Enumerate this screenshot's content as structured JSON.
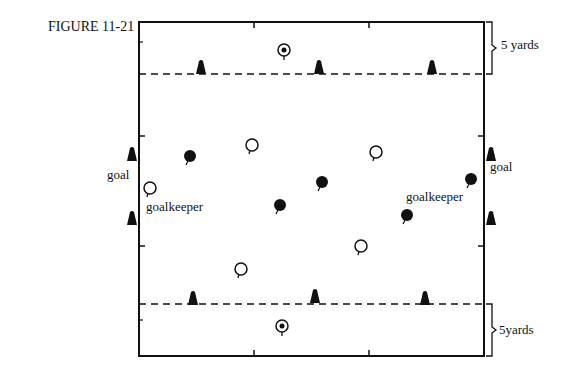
{
  "figure": {
    "title": "FIGURE 11-21",
    "labels": {
      "top_distance": "5 yards",
      "bottom_distance": "5yards",
      "goal_left": "goal",
      "goal_right": "goal",
      "goalkeeper_left": "goalkeeper",
      "goalkeeper_right": "goalkeeper"
    },
    "field": {
      "left": 139,
      "top": 22,
      "right": 484,
      "bottom": 356
    },
    "zone_lines_y": [
      74,
      304
    ],
    "cones": [
      {
        "x": 201,
        "y": 68
      },
      {
        "x": 319,
        "y": 68
      },
      {
        "x": 432,
        "y": 68
      },
      {
        "x": 193,
        "y": 299
      },
      {
        "x": 315,
        "y": 297
      },
      {
        "x": 425,
        "y": 299
      },
      {
        "x": 132,
        "y": 155
      },
      {
        "x": 132,
        "y": 219
      },
      {
        "x": 491,
        "y": 155
      },
      {
        "x": 491,
        "y": 219
      }
    ],
    "players_dark": [
      {
        "x": 190,
        "y": 156
      },
      {
        "x": 322,
        "y": 182
      },
      {
        "x": 280,
        "y": 205
      },
      {
        "x": 471,
        "y": 179
      },
      {
        "x": 407,
        "y": 215
      }
    ],
    "players_light": [
      {
        "x": 252,
        "y": 145
      },
      {
        "x": 376,
        "y": 152
      },
      {
        "x": 150,
        "y": 188
      },
      {
        "x": 241,
        "y": 269
      },
      {
        "x": 361,
        "y": 246
      }
    ],
    "servers": [
      {
        "x": 284,
        "y": 50
      },
      {
        "x": 282,
        "y": 326
      }
    ]
  }
}
